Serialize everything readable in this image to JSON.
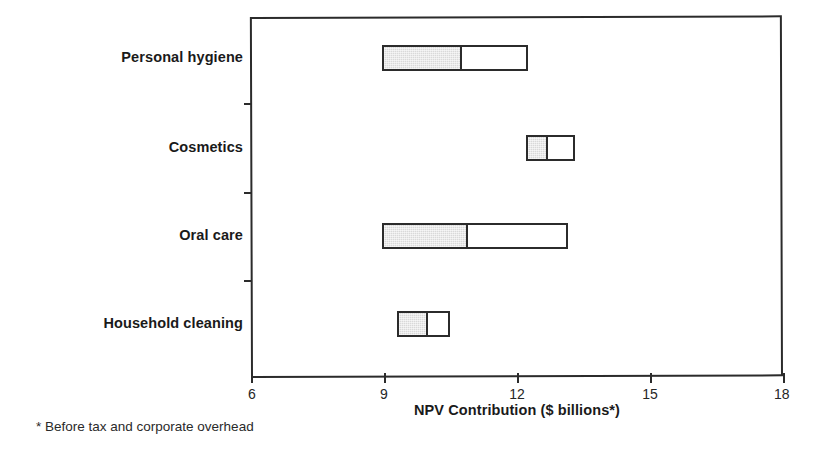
{
  "chart_data": {
    "type": "bar",
    "orientation": "horizontal",
    "title": "",
    "subtitle": "",
    "xlabel": "NPV Contribution ($ billions*)",
    "ylabel": "",
    "xlim": [
      6,
      18
    ],
    "xticks": [
      6,
      9,
      12,
      15,
      18
    ],
    "xticklabels": [
      "6",
      "9",
      "12",
      "15",
      "18"
    ],
    "grid": false,
    "legend": null,
    "footnote": "* Before tax and corporate overhead",
    "bar_style": "floating range bar split into two stacked segments (shaded low half, open high half)",
    "categories": [
      "Personal hygiene",
      "Cosmetics",
      "Oral care",
      "Household cleaning"
    ],
    "series": [
      {
        "name": "Low segment (shaded)",
        "values": [
          [
            8.95,
            10.75
          ],
          [
            12.2,
            12.7
          ],
          [
            8.95,
            10.9
          ],
          [
            9.3,
            10.0
          ]
        ]
      },
      {
        "name": "High segment (open)",
        "values": [
          [
            10.75,
            12.25
          ],
          [
            12.7,
            13.3
          ],
          [
            10.9,
            13.15
          ],
          [
            10.0,
            10.5
          ]
        ]
      }
    ],
    "bars": [
      {
        "category": "Personal hygiene",
        "start": 8.95,
        "mid": 10.75,
        "end": 12.25
      },
      {
        "category": "Cosmetics",
        "start": 12.2,
        "mid": 12.7,
        "end": 13.3
      },
      {
        "category": "Oral care",
        "start": 8.95,
        "mid": 10.9,
        "end": 13.15
      },
      {
        "category": "Household cleaning",
        "start": 9.3,
        "mid": 10.0,
        "end": 10.5
      }
    ]
  },
  "colors": {
    "axis": "#2b2b2b",
    "shaded_segment": "#d9d9d9",
    "open_segment": "#ffffff",
    "text": "#1a1a1a",
    "background": "#ffffff"
  },
  "axis": {
    "xtitle": "NPV Contribution ($ billions*)",
    "ticks": [
      {
        "label": "6"
      },
      {
        "label": "9"
      },
      {
        "label": "12"
      },
      {
        "label": "15"
      },
      {
        "label": "18"
      }
    ]
  },
  "categories": [
    {
      "label": "Personal hygiene"
    },
    {
      "label": "Cosmetics"
    },
    {
      "label": "Oral care"
    },
    {
      "label": "Household cleaning"
    }
  ],
  "footnote": {
    "text": "* Before tax and corporate overhead"
  }
}
